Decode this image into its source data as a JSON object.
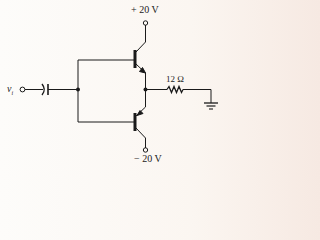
{
  "diagram": {
    "type": "circuit-schematic",
    "supply_positive": "+ 20 V",
    "supply_negative": "− 20 V",
    "input_label": "v",
    "input_subscript": "i",
    "load_resistor": "12 Ω",
    "components": [
      {
        "name": "input-terminal",
        "label": "vi"
      },
      {
        "name": "coupling-capacitor"
      },
      {
        "name": "npn-transistor-top",
        "collector": "+20 V"
      },
      {
        "name": "pnp-transistor-bottom",
        "collector": "-20 V"
      },
      {
        "name": "load-resistor",
        "value": "12 Ω"
      },
      {
        "name": "ground"
      }
    ]
  }
}
